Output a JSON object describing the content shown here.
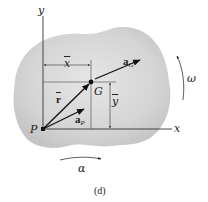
{
  "figure": {
    "caption": "(d)",
    "body_fill_color": "#d6d6d6",
    "line_color": "#333333"
  },
  "axes": {
    "y_label": "y",
    "x_label": "x"
  },
  "points": {
    "origin_label": "P",
    "center_of_mass_label": "G"
  },
  "dimensions": {
    "x_bar": "x",
    "y_bar": "y"
  },
  "vectors": {
    "r_bar": {
      "label": "r"
    },
    "a_G": {
      "label": "a",
      "subscript": "G"
    },
    "a_P": {
      "label": "a",
      "subscript": "P"
    }
  },
  "rotation": {
    "omega_label": "ω",
    "alpha_label": "α"
  }
}
